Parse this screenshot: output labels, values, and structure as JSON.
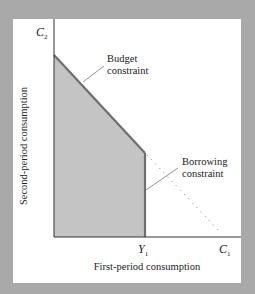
{
  "diagram": {
    "y_axis_symbol": "C",
    "y_axis_subscript": "2",
    "x_axis_symbol": "C",
    "x_axis_subscript": "1",
    "income_symbol": "Y",
    "income_subscript": "1",
    "y_axis_label": "Second-period consumption",
    "x_axis_label": "First-period consumption",
    "annotations": {
      "budget_line1": "Budget",
      "budget_line2": "constraint",
      "borrowing_line1": "Borrowing",
      "borrowing_line2": "constraint"
    },
    "colors": {
      "background": "#a9a9a9",
      "panel": "#ffffff",
      "shaded_region": "#c4c4c4",
      "constraint_line": "#6e6e6e",
      "axis": "#333333"
    }
  }
}
